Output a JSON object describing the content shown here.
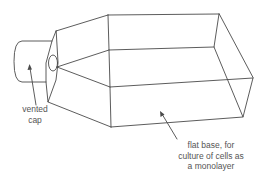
{
  "diagram": {
    "colors": {
      "line": "#4a4a4a",
      "text": "#555555",
      "background": "#ffffff"
    },
    "labels": {
      "cap": {
        "lines": [
          "vented",
          "cap"
        ]
      },
      "base": {
        "lines": [
          "flat base, for",
          "culture of cells as",
          "a monolayer"
        ]
      }
    }
  }
}
